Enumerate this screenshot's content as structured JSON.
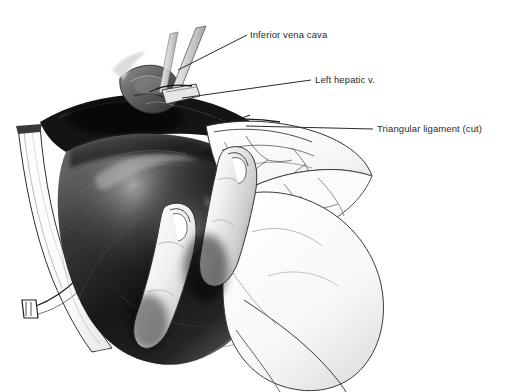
{
  "figure": {
    "kind": "surgical-illustration",
    "background_color": "#ffffff",
    "ink_color": "#2b2b2b",
    "width": 509,
    "height": 392
  },
  "labels": [
    {
      "id": "inferior-vena-cava",
      "text": "Inferior vena cava",
      "text_x": 250,
      "text_y": 29,
      "leader": {
        "x1": 247,
        "y1": 35,
        "x2": 178,
        "y2": 70
      }
    },
    {
      "id": "left-hepatic-vein",
      "text": "Left hepatic v.",
      "text_x": 315,
      "text_y": 74,
      "leader": {
        "x1": 311,
        "y1": 80,
        "x2": 182,
        "y2": 98
      }
    },
    {
      "id": "triangular-ligament-cut",
      "text": "Triangular ligament (cut)",
      "text_x": 377,
      "text_y": 123,
      "leader": {
        "x1": 373,
        "y1": 129,
        "x2": 246,
        "y2": 126
      }
    }
  ],
  "anatomy": {
    "liver": {
      "name": "Liver (right lobe, dark shaded mass)",
      "tone": "#1a1a1a"
    },
    "hand": {
      "name": "Surgeon's gloved hand retracting liver",
      "tone": "#f2f2f2"
    },
    "ligament": {
      "name": "Triangular ligament, cut edge",
      "tone": "#fbfbfb"
    },
    "drape": {
      "name": "Pale membrane / drape strip at left",
      "tone": "#fdfdfd"
    },
    "clamp_top": {
      "name": "Instrument shafts at superior field"
    },
    "clamp_lower_left": {
      "name": "Clamp tip on ligament edge"
    }
  }
}
